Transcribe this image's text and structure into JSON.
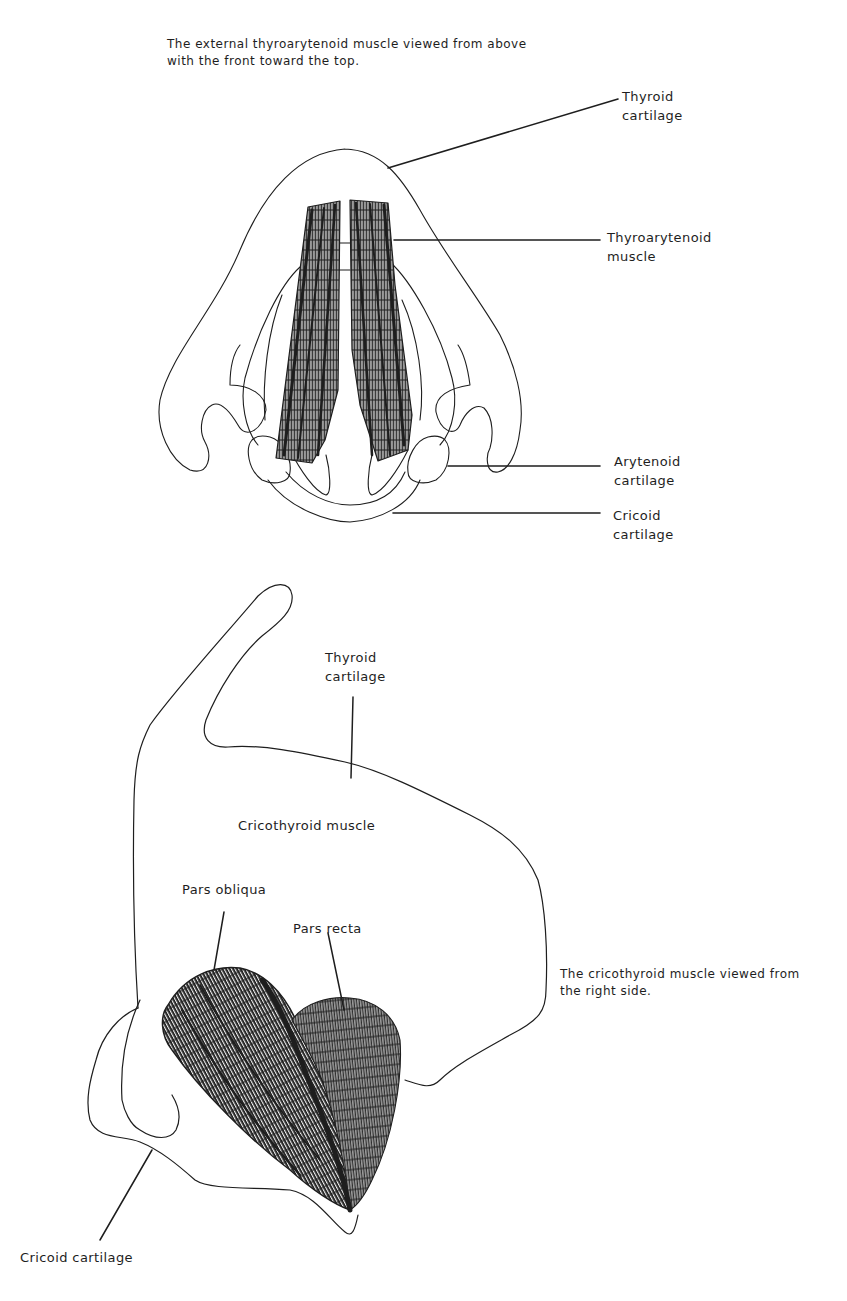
{
  "figure_top": {
    "caption": "The external thyroarytenoid muscle viewed from above\nwith the front toward the top.",
    "labels": {
      "thyroid_cartilage": "Thyroid\ncartilage",
      "thyroarytenoid_muscle": "Thyroarytenoid\nmuscle",
      "arytenoid_cartilage": "Arytenoid\ncartilage",
      "cricoid_cartilage": "Cricoid\ncartilage"
    }
  },
  "figure_bottom": {
    "caption": "The cricothyroid muscle viewed from\nthe right side.",
    "labels": {
      "thyroid_cartilage": "Thyroid\ncartilage",
      "cricothyroid_muscle": "Cricothyroid muscle",
      "pars_obliqua": "Pars obliqua",
      "pars_recta": "Pars recta",
      "cricoid_cartilage": "Cricoid cartilage"
    }
  },
  "colors": {
    "ink": "#1e1e1e",
    "paper": "#ffffff"
  }
}
